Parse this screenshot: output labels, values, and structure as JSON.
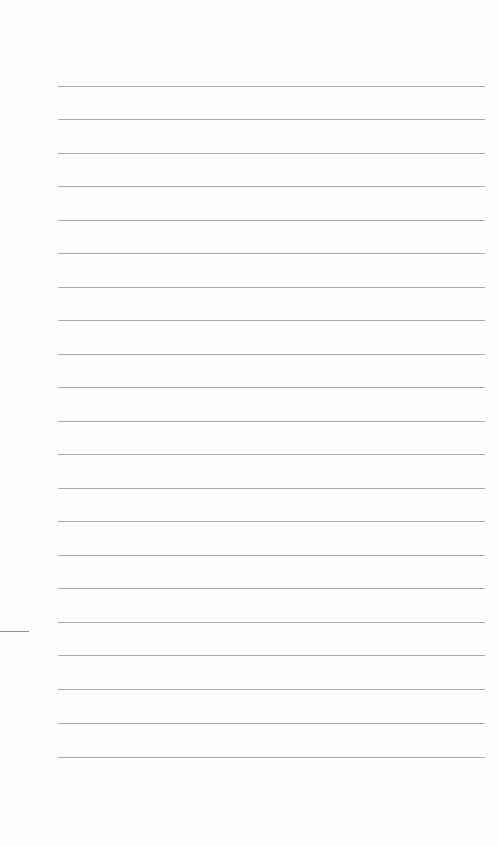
{
  "page": {
    "type": "blank lined paper",
    "background_color": "#fefefe",
    "rule_color": "#9a9a9a",
    "rule_count": 21,
    "rules_y": [
      86,
      119,
      153,
      186,
      220,
      253,
      287,
      320,
      354,
      387,
      421,
      454,
      488,
      521,
      555,
      588,
      622,
      655,
      689,
      723,
      757
    ],
    "rule_x_start": 58,
    "rule_x_end": 485,
    "margin_mark": {
      "y": 631,
      "x_start": 0,
      "x_end": 29
    }
  }
}
